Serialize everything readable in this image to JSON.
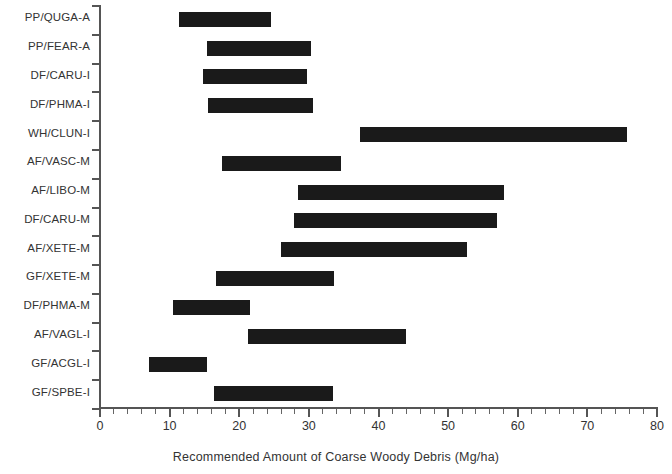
{
  "chart_data": {
    "type": "bar",
    "orientation": "horizontal",
    "subtype": "range-bar",
    "title": "",
    "xlabel": "Recommended Amount of Coarse Woody Debris (Mg/ha)",
    "ylabel": "",
    "xlim": [
      0,
      80
    ],
    "xticks": [
      0,
      10,
      20,
      30,
      40,
      50,
      60,
      70,
      80
    ],
    "xtick_labels": [
      "0",
      "10",
      "20",
      "30",
      "40",
      "50",
      "60",
      "70",
      "80"
    ],
    "minor_tick_step": 2,
    "grid": false,
    "legend": null,
    "bar_color": "#1a1a1a",
    "axis_color": "#555555",
    "categories": [
      "PP/QUGA-A",
      "PP/FEAR-A",
      "DF/CARU-I",
      "DF/PHMA-I",
      "WH/CLUN-I",
      "AF/VASC-M",
      "AF/LIBO-M",
      "DF/CARU-M",
      "AF/XETE-M",
      "GF/XETE-M",
      "DF/PHMA-M",
      "AF/VAGL-I",
      "GF/ACGL-I",
      "GF/SPBE-I"
    ],
    "ranges": [
      {
        "category": "PP/QUGA-A",
        "low": 11.4,
        "high": 24.5
      },
      {
        "category": "PP/FEAR-A",
        "low": 15.4,
        "high": 30.3
      },
      {
        "category": "DF/CARU-I",
        "low": 14.8,
        "high": 29.7
      },
      {
        "category": "DF/PHMA-I",
        "low": 15.5,
        "high": 30.6
      },
      {
        "category": "WH/CLUN-I",
        "low": 37.4,
        "high": 75.7
      },
      {
        "category": "AF/VASC-M",
        "low": 17.5,
        "high": 34.6
      },
      {
        "category": "AF/LIBO-M",
        "low": 28.4,
        "high": 58.0
      },
      {
        "category": "DF/CARU-M",
        "low": 27.9,
        "high": 57.0
      },
      {
        "category": "AF/XETE-M",
        "low": 26.0,
        "high": 52.7
      },
      {
        "category": "GF/XETE-M",
        "low": 16.7,
        "high": 33.6
      },
      {
        "category": "DF/PHMA-M",
        "low": 10.5,
        "high": 21.6
      },
      {
        "category": "AF/VAGL-I",
        "low": 21.3,
        "high": 43.9
      },
      {
        "category": "GF/ACGL-I",
        "low": 7.0,
        "high": 15.4
      },
      {
        "category": "GF/SPBE-I",
        "low": 16.4,
        "high": 33.4
      }
    ]
  }
}
